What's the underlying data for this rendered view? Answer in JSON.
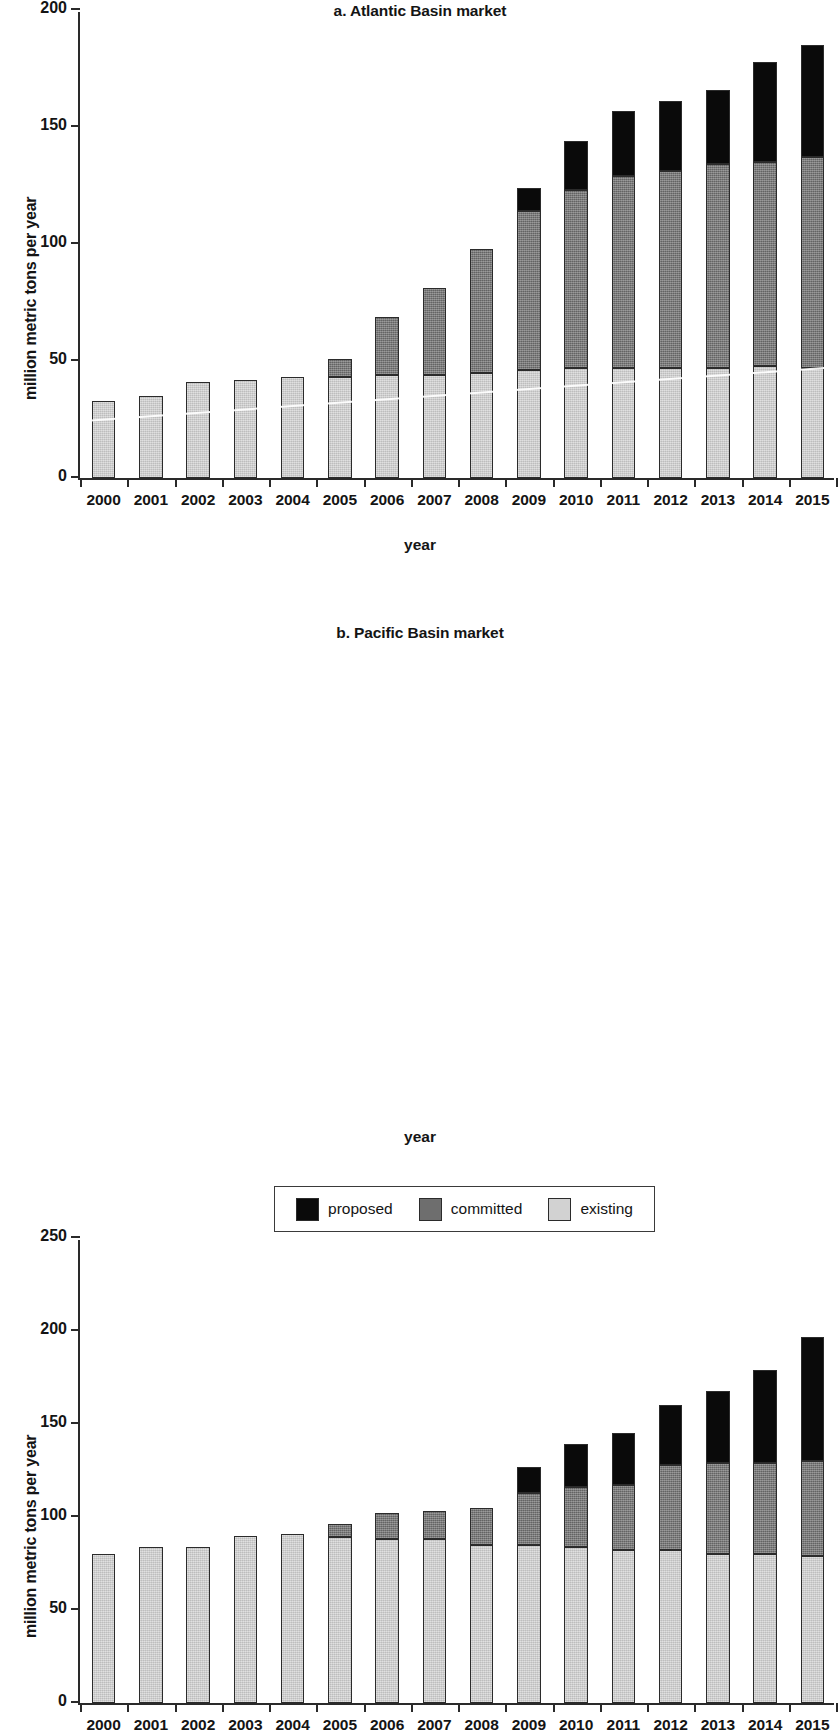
{
  "figure": {
    "panels": [
      {
        "id": "a",
        "title": "a. Atlantic Basin market",
        "ylabel": "million metric tons per year",
        "xlabel": "year"
      },
      {
        "id": "b",
        "title": "b. Pacific Basin market",
        "ylabel": "million metric tons per year",
        "xlabel": "year"
      }
    ],
    "legend": {
      "items": [
        {
          "label": "proposed",
          "color": "#0a0a0a"
        },
        {
          "label": "committed",
          "color": "#6e6e6e"
        },
        {
          "label": "existing",
          "color": "#d2d2d2"
        }
      ]
    }
  },
  "chart_data": [
    {
      "type": "bar",
      "stacked": true,
      "panel": "a",
      "title": "a. Atlantic Basin market",
      "xlabel": "year",
      "ylabel": "million metric tons per year",
      "ylim": [
        0,
        200
      ],
      "yticks": [
        0,
        50,
        100,
        150,
        200
      ],
      "grid": false,
      "legend_position": "below-figure",
      "categories": [
        "2000",
        "2001",
        "2002",
        "2003",
        "2004",
        "2005",
        "2006",
        "2007",
        "2008",
        "2009",
        "2010",
        "2011",
        "2012",
        "2013",
        "2014",
        "2015"
      ],
      "series": [
        {
          "name": "existing",
          "color": "#d2d2d2",
          "values": [
            33,
            35,
            41,
            42,
            43,
            43,
            44,
            44,
            45,
            46,
            47,
            47,
            47,
            47,
            48,
            47
          ]
        },
        {
          "name": "committed",
          "color": "#6e6e6e",
          "values": [
            0,
            0,
            0,
            0,
            0,
            8,
            25,
            37,
            53,
            68,
            76,
            82,
            84,
            87,
            87,
            90
          ]
        },
        {
          "name": "proposed",
          "color": "#0a0a0a",
          "values": [
            0,
            0,
            0,
            0,
            0,
            0,
            0,
            0,
            0,
            10,
            21,
            28,
            30,
            32,
            43,
            48
          ]
        }
      ],
      "totals": [
        33,
        35,
        41,
        42,
        43,
        51,
        69,
        81,
        98,
        124,
        144,
        157,
        161,
        166,
        178,
        185
      ]
    },
    {
      "type": "bar",
      "stacked": true,
      "panel": "b",
      "title": "b. Pacific Basin market",
      "xlabel": "year",
      "ylabel": "million metric tons per year",
      "ylim": [
        0,
        250
      ],
      "yticks": [
        0,
        50,
        100,
        150,
        200,
        250
      ],
      "grid": false,
      "legend_position": "below-figure",
      "categories": [
        "2000",
        "2001",
        "2002",
        "2003",
        "2004",
        "2005",
        "2006",
        "2007",
        "2008",
        "2009",
        "2010",
        "2011",
        "2012",
        "2013",
        "2014",
        "2015"
      ],
      "series": [
        {
          "name": "existing",
          "color": "#d2d2d2",
          "values": [
            80,
            84,
            84,
            90,
            91,
            89,
            88,
            88,
            85,
            85,
            84,
            82,
            82,
            80,
            80,
            79
          ]
        },
        {
          "name": "committed",
          "color": "#6e6e6e",
          "values": [
            0,
            0,
            0,
            0,
            0,
            7,
            14,
            15,
            20,
            28,
            32,
            35,
            46,
            49,
            49,
            51
          ]
        },
        {
          "name": "proposed",
          "color": "#0a0a0a",
          "values": [
            0,
            0,
            0,
            0,
            0,
            0,
            0,
            0,
            0,
            14,
            23,
            28,
            32,
            39,
            50,
            67
          ]
        }
      ],
      "totals": [
        80,
        84,
        84,
        90,
        91,
        96,
        102,
        103,
        105,
        127,
        139,
        145,
        160,
        168,
        179,
        197
      ]
    }
  ]
}
